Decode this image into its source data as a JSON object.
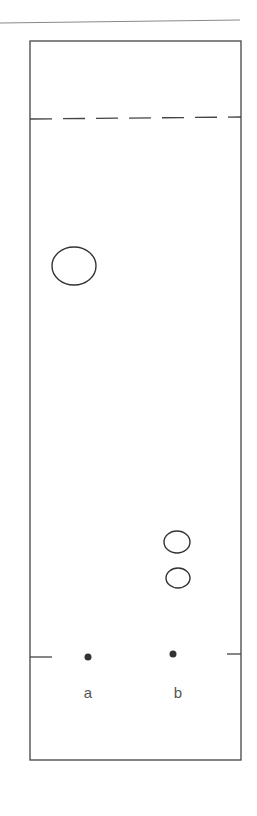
{
  "diagram": {
    "type": "thin-layer-chromatography-plate",
    "colors": {
      "stroke": "#444444",
      "spot_fill": "#333333",
      "label": "#555555",
      "background": "#ffffff"
    },
    "lanes": [
      {
        "label": "a",
        "origin_spot": {
          "x": 88,
          "y": 657
        }
      },
      {
        "label": "b",
        "origin_spot": {
          "x": 173,
          "y": 654
        }
      }
    ],
    "developed_spots": [
      {
        "lane": "a",
        "cx": 74,
        "cy": 266,
        "rx": 22,
        "ry": 19
      },
      {
        "lane": "b",
        "cx": 177,
        "cy": 542,
        "rx": 13,
        "ry": 11
      },
      {
        "lane": "b",
        "cx": 178,
        "cy": 578,
        "rx": 12,
        "ry": 10
      }
    ],
    "solvent_front": "dashed line",
    "baseline": "origin line with edge ticks"
  }
}
